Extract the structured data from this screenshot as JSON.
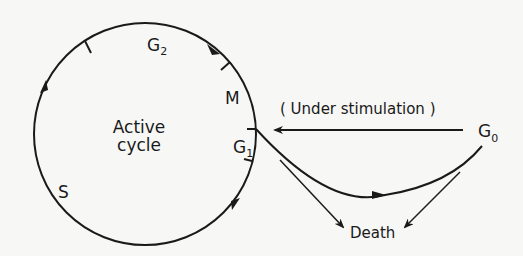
{
  "diagram": {
    "center_label": [
      "Active",
      "cycle"
    ],
    "phases": [
      {
        "name": "G",
        "sub": "2"
      },
      {
        "name": "M",
        "sub": ""
      },
      {
        "name": "G",
        "sub": "1"
      },
      {
        "name": "S",
        "sub": ""
      }
    ],
    "quiescent": {
      "name": "G",
      "sub": "0"
    },
    "stimulation_label": "( Under stimulation )",
    "death_label": "Death",
    "colors": {
      "line": "#1a1a1a",
      "background": "#f7f7f5"
    }
  }
}
